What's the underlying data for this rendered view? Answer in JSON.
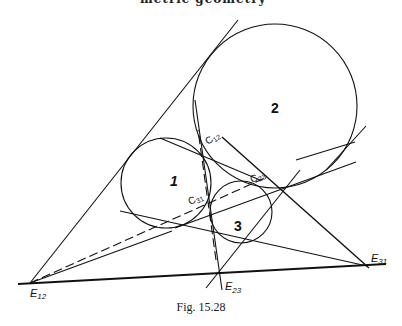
{
  "header": {
    "running_head": "metric geometry"
  },
  "caption": "Fig. 15.28",
  "circles": [
    {
      "id": "1",
      "label": "1",
      "cx": 166,
      "cy": 183,
      "r": 45
    },
    {
      "id": "2",
      "label": "2",
      "cx": 275,
      "cy": 106,
      "r": 82
    },
    {
      "id": "3",
      "label": "3",
      "cx": 241,
      "cy": 212,
      "r": 31
    }
  ],
  "points": {
    "E12": {
      "label": "E",
      "sub": "12",
      "x": 30,
      "y": 283
    },
    "E23": {
      "label": "E",
      "sub": "23",
      "x": 220,
      "y": 273
    },
    "E31": {
      "label": "E",
      "sub": "31",
      "x": 363,
      "y": 265
    },
    "C12": {
      "label": "C",
      "sub": "12"
    },
    "C23": {
      "label": "C",
      "sub": "23"
    },
    "C31": {
      "label": "C",
      "sub": "31"
    }
  }
}
